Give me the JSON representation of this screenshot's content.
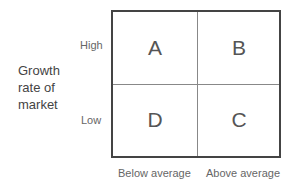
{
  "diagram": {
    "type": "2x2 matrix",
    "y_axis": {
      "title_lines": [
        "Growth",
        "rate of",
        "market"
      ],
      "high_label": "High",
      "low_label": "Low"
    },
    "x_axis": {
      "left_label": "Below average",
      "right_label": "Above average"
    },
    "quadrants": {
      "top_left": "A",
      "top_right": "B",
      "bottom_left": "D",
      "bottom_right": "C"
    }
  }
}
